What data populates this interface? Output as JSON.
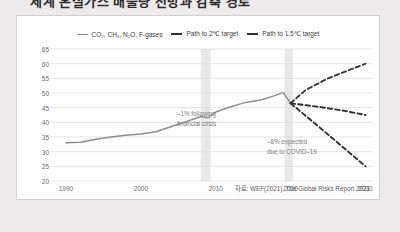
{
  "page": {
    "headline_clipped": "세계 온실가스 배출량 전망과 감축 경로",
    "source_note": "자료: WEF(2021), The Global Risks Report 2021"
  },
  "legend": {
    "items": [
      {
        "label": "CO₂, CH₄, N₂O, F-gases",
        "style": "thin",
        "color": "#8d8d8d"
      },
      {
        "label": "Path to 2℃ target",
        "style": "thick",
        "color": "#2f2f2f"
      },
      {
        "label": "Path to 1.5℃ target",
        "style": "thick",
        "color": "#2f2f2f"
      }
    ]
  },
  "annotations": {
    "crisis_line1": "–1% following",
    "crisis_line2": "financial crisis",
    "covid_line1": "–8% expected",
    "covid_line2": "due to COVID–19"
  },
  "chart_data": {
    "type": "line",
    "title": "",
    "xlabel": "",
    "ylabel": "",
    "xlim": [
      1988,
      2031
    ],
    "ylim": [
      20,
      65
    ],
    "yticks": [
      20,
      25,
      30,
      35,
      40,
      45,
      50,
      55,
      60,
      65
    ],
    "xticks": [
      1990,
      2000,
      2010,
      2020,
      2030
    ],
    "grid": true,
    "legend_position": "top-center",
    "shaded_bands": [
      {
        "label": "financial crisis",
        "x0": 2008,
        "x1": 2009.3
      },
      {
        "label": "covid-19",
        "x0": 2019.2,
        "x1": 2020.3
      }
    ],
    "series": [
      {
        "name": "CO₂, CH₄, N₂O, F-gases",
        "style": "solid",
        "color": "#8d8d8d",
        "points": [
          [
            1990,
            33.0
          ],
          [
            1992,
            33.2
          ],
          [
            1994,
            34.2
          ],
          [
            1996,
            35.0
          ],
          [
            1998,
            35.6
          ],
          [
            2000,
            36.0
          ],
          [
            2002,
            36.8
          ],
          [
            2004,
            38.5
          ],
          [
            2006,
            40.2
          ],
          [
            2008,
            42.0
          ],
          [
            2009,
            41.6
          ],
          [
            2010,
            43.5
          ],
          [
            2012,
            45.3
          ],
          [
            2014,
            46.8
          ],
          [
            2016,
            47.6
          ],
          [
            2018,
            49.2
          ],
          [
            2019,
            50.2
          ],
          [
            2020,
            46.5
          ]
        ]
      },
      {
        "name": "Business as usual",
        "style": "dashed",
        "color": "#3a3a3a",
        "points": [
          [
            2020,
            46.5
          ],
          [
            2022,
            51.0
          ],
          [
            2025,
            55.0
          ],
          [
            2030,
            60.0
          ]
        ]
      },
      {
        "name": "Path to 2℃ target",
        "style": "dashed",
        "color": "#2f2f2f",
        "points": [
          [
            2020,
            46.5
          ],
          [
            2024,
            45.2
          ],
          [
            2027,
            44.0
          ],
          [
            2030,
            42.5
          ]
        ]
      },
      {
        "name": "Path to 1.5℃ target",
        "style": "dashed",
        "color": "#2f2f2f",
        "points": [
          [
            2020,
            46.5
          ],
          [
            2024,
            38.0
          ],
          [
            2027,
            31.5
          ],
          [
            2030,
            25.0
          ]
        ]
      }
    ]
  }
}
